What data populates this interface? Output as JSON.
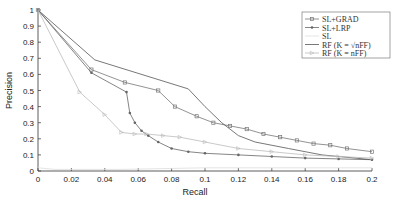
{
  "chart_data": {
    "type": "line",
    "title": "",
    "xlabel": "Recall",
    "ylabel": "Precision",
    "xlim": [
      0,
      0.2
    ],
    "ylim": [
      0,
      1
    ],
    "xticks": [
      "0",
      "0.02",
      "0.04",
      "0.06",
      "0.08",
      "0.1",
      "0.12",
      "0.14",
      "0.16",
      "0.18",
      "0.2"
    ],
    "yticks": [
      "0",
      "0.1",
      "0.2",
      "0.3",
      "0.4",
      "0.5",
      "0.6",
      "0.7",
      "0.8",
      "0.9",
      "1"
    ],
    "grid": false,
    "legend_position": "upper right",
    "series": [
      {
        "name": "SL+GRAD",
        "color": "#777777",
        "marker": "square",
        "x": [
          0,
          0.032,
          0.052,
          0.072,
          0.082,
          0.095,
          0.105,
          0.115,
          0.125,
          0.135,
          0.145,
          0.155,
          0.165,
          0.175,
          0.185,
          0.2
        ],
        "y": [
          1.0,
          0.63,
          0.55,
          0.5,
          0.4,
          0.34,
          0.3,
          0.28,
          0.26,
          0.23,
          0.21,
          0.19,
          0.17,
          0.16,
          0.14,
          0.12
        ]
      },
      {
        "name": "SL+LRP",
        "color": "#666666",
        "marker": "dot",
        "x": [
          0,
          0.032,
          0.053,
          0.055,
          0.058,
          0.062,
          0.066,
          0.072,
          0.08,
          0.09,
          0.1,
          0.12,
          0.14,
          0.16,
          0.18,
          0.2
        ],
        "y": [
          1.0,
          0.61,
          0.49,
          0.36,
          0.3,
          0.25,
          0.22,
          0.18,
          0.14,
          0.12,
          0.11,
          0.1,
          0.09,
          0.08,
          0.075,
          0.07
        ]
      },
      {
        "name": "SL",
        "color": "#dddddd",
        "marker": "none",
        "x": [
          0,
          0.01,
          0.05,
          0.1,
          0.15,
          0.2
        ],
        "y": [
          0.02,
          0.01,
          0.01,
          0.02,
          0.02,
          0.02
        ]
      },
      {
        "name": "RF (K = √n_FF)",
        "color": "#555555",
        "marker": "none",
        "x": [
          0,
          0.034,
          0.09,
          0.1,
          0.11,
          0.12,
          0.13,
          0.15,
          0.17,
          0.2
        ],
        "y": [
          1.0,
          0.69,
          0.51,
          0.4,
          0.3,
          0.22,
          0.18,
          0.14,
          0.1,
          0.07
        ]
      },
      {
        "name": "RF (K = n_FF)",
        "color": "#bbbbbb",
        "marker": "triangle",
        "x": [
          0,
          0.025,
          0.04,
          0.05,
          0.058,
          0.065,
          0.075,
          0.085,
          0.1,
          0.12,
          0.14,
          0.16,
          0.18,
          0.2
        ],
        "y": [
          1.0,
          0.49,
          0.35,
          0.24,
          0.23,
          0.23,
          0.22,
          0.21,
          0.18,
          0.14,
          0.12,
          0.1,
          0.09,
          0.08
        ]
      }
    ]
  },
  "legend": {
    "items": [
      {
        "label": "SL+GRAD"
      },
      {
        "label": "SL+LRP"
      },
      {
        "label": "SL"
      },
      {
        "label": "RF (K = √nFF)"
      },
      {
        "label": "RF (K = nFF)"
      }
    ]
  }
}
